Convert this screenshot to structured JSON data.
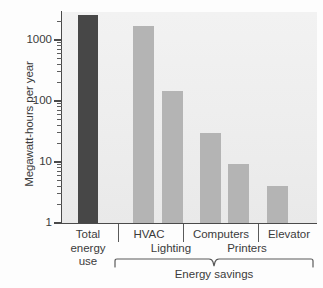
{
  "chart_data": {
    "type": "bar",
    "title": "",
    "xlabel": "",
    "ylabel": "Megawatt-hours per year",
    "yscale": "log",
    "ylim": [
      1,
      4000
    ],
    "ytick_labels": [
      "1000",
      "100",
      "10",
      "1"
    ],
    "ytick_values": [
      1000,
      100,
      10,
      1
    ],
    "grid": false,
    "legend": null,
    "categories": [
      "Total energy use",
      "HVAC",
      "Lighting",
      "Computers",
      "Printers",
      "Elevator"
    ],
    "values": [
      2600,
      1700,
      145,
      30,
      9.3,
      4.1
    ],
    "bar_colors": [
      "#474747",
      "#b4b4b4",
      "#b4b4b4",
      "#b4b4b4",
      "#b4b4b4",
      "#b4b4b4"
    ],
    "group_annotation": "Energy savings",
    "group_members": [
      "HVAC",
      "Lighting",
      "Computers",
      "Printers",
      "Elevator"
    ]
  },
  "axis": {
    "y_title": "Megawatt-hours per year",
    "ticks": [
      {
        "label": "1000"
      },
      {
        "label": "100"
      },
      {
        "label": "10"
      },
      {
        "label": "1"
      }
    ]
  },
  "xaxis": {
    "total_line1": "Total",
    "total_line2": "energy",
    "total_line3": "use",
    "hvac": "HVAC",
    "lighting": "Lighting",
    "computers": "Computers",
    "printers": "Printers",
    "elevator": "Elevator",
    "group_label": "Energy savings"
  }
}
